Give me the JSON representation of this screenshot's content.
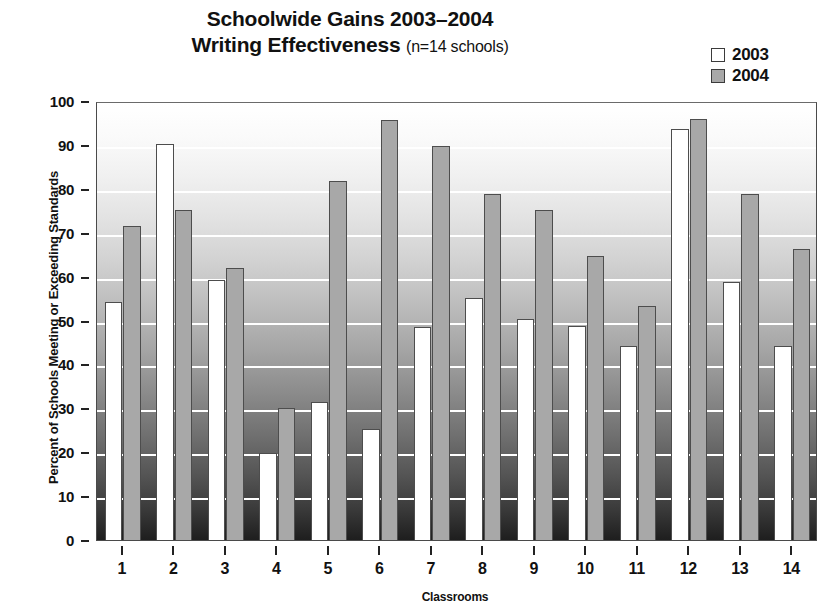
{
  "title": {
    "line1": "Schoolwide Gains 2003–2004",
    "line2": "Writing Effectiveness",
    "subtitle": "(n=14 schools)"
  },
  "legend": {
    "position": "top-right",
    "items": [
      {
        "label": "2003",
        "color": "#ffffff"
      },
      {
        "label": "2004",
        "color": "#a8a8a8"
      }
    ]
  },
  "axes": {
    "ylabel": "Percent of Schools Meeting or Exceeding Standards",
    "xlabel": "Classrooms",
    "yticks": [
      "100",
      "90",
      "80",
      "70",
      "60",
      "50",
      "40",
      "30",
      "20",
      "10",
      "0"
    ],
    "xticks": [
      "1",
      "2",
      "3",
      "4",
      "5",
      "6",
      "7",
      "8",
      "9",
      "10",
      "11",
      "12",
      "13",
      "14"
    ]
  },
  "chart_data": {
    "type": "bar",
    "title": "Schoolwide Gains 2003–2004 Writing Effectiveness (n=14 schools)",
    "xlabel": "Classrooms",
    "ylabel": "Percent of Schools Meeting or Exceeding Standards",
    "ylim": [
      0,
      100
    ],
    "ytick_step": 10,
    "grid": true,
    "grid_axis": "y",
    "legend_position": "top-right",
    "categories": [
      "1",
      "2",
      "3",
      "4",
      "5",
      "6",
      "7",
      "8",
      "9",
      "10",
      "11",
      "12",
      "13",
      "14"
    ],
    "series": [
      {
        "name": "2003",
        "color": "#ffffff",
        "values": [
          54.2,
          90.2,
          59.3,
          19.8,
          31.4,
          25.2,
          48.6,
          55.2,
          50.4,
          48.7,
          44.3,
          93.7,
          58.7,
          44.1
        ]
      },
      {
        "name": "2004",
        "color": "#a8a8a8",
        "values": [
          71.6,
          75.2,
          61.9,
          30.1,
          81.7,
          95.6,
          89.8,
          78.9,
          75.2,
          64.6,
          53.2,
          95.8,
          78.9,
          66.4
        ]
      }
    ]
  }
}
